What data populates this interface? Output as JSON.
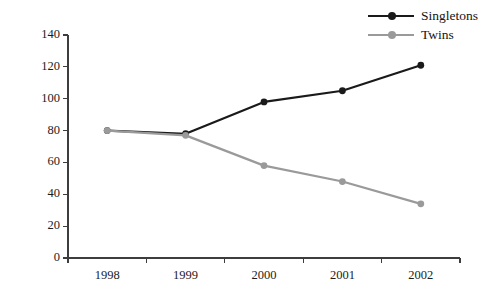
{
  "chart_data": {
    "type": "line",
    "title": "",
    "xlabel": "",
    "ylabel": "",
    "categories": [
      "1998",
      "1999",
      "2000",
      "2001",
      "2002"
    ],
    "ylim": [
      0,
      140
    ],
    "yticks": [
      0,
      20,
      40,
      60,
      80,
      100,
      120,
      140
    ],
    "ytick_labels": [
      "0",
      "20",
      "40",
      "60",
      "80",
      "100",
      "120",
      "140"
    ],
    "grid": false,
    "legend_position": "top-right",
    "series": [
      {
        "name": "Singletons",
        "color": "#1a1a1a",
        "marker": "circle",
        "values": [
          80,
          78,
          98,
          105,
          121
        ]
      },
      {
        "name": "Twins",
        "color": "#9a9a9a",
        "marker": "circle",
        "values": [
          80,
          77,
          58,
          48,
          34
        ]
      }
    ]
  },
  "legend": {
    "entries": [
      {
        "label": "Singletons"
      },
      {
        "label": "Twins"
      }
    ]
  },
  "axis": {
    "line_color": "#3d3d3d"
  }
}
